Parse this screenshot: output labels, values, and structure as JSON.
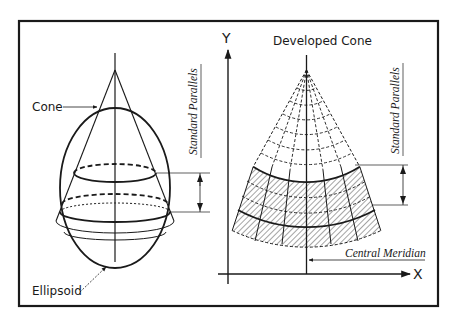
{
  "figure": {
    "left_panel": {
      "cone_label": "Cone",
      "ellipsoid_label": "Ellipsoid",
      "standard_parallels_label": "Standard Parallels"
    },
    "right_panel": {
      "title": "Developed Cone",
      "y_axis_label": "Y",
      "x_axis_label": "X",
      "standard_parallels_label": "Standard Parallels",
      "central_meridian_label": "Central Meridian"
    },
    "colors": {
      "ink": "#1a1a1a",
      "background": "#ffffff"
    }
  }
}
